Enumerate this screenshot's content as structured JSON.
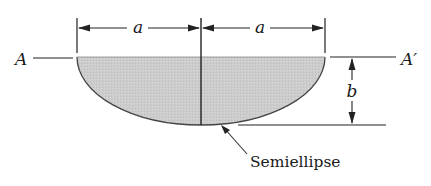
{
  "figure": {
    "shape": "semiellipse",
    "fill_color": "#c9c9c9",
    "stroke_color": "#333333",
    "labels": {
      "axis_left": "A",
      "axis_right": "A′",
      "half_width_left": "a",
      "half_width_right": "a",
      "depth": "b",
      "callout": "Semiellipse"
    },
    "geometry": {
      "center_x": 201,
      "top_y": 57,
      "semi_major_px": 124,
      "semi_minor_px": 68
    }
  }
}
